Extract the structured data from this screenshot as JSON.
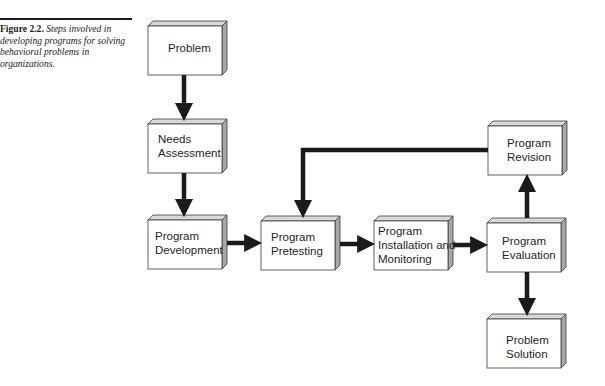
{
  "caption": {
    "figure_label": "Figure 2.2.",
    "text": "Steps involved in developing programs for solving behavioral problems in organizations."
  },
  "colors": {
    "box_face": "#ffffff",
    "box_top": "#d9d9d9",
    "box_side": "#a8a8a8",
    "box_border": "#3a3a3a",
    "arrow": "#1a1a1a"
  },
  "boxes": [
    {
      "id": "problem",
      "label": "Problem"
    },
    {
      "id": "needs-assessment",
      "label": "Needs\nAssessment"
    },
    {
      "id": "program-development",
      "label": "Program\nDevelopment"
    },
    {
      "id": "program-pretesting",
      "label": "Program\nPretesting"
    },
    {
      "id": "program-installation",
      "label": "Program\nInstallation and\nMonitoring"
    },
    {
      "id": "program-evaluation",
      "label": "Program\nEvaluation"
    },
    {
      "id": "program-revision",
      "label": "Program\nRevision"
    },
    {
      "id": "problem-solution",
      "label": "Problem\nSolution"
    }
  ],
  "edges": [
    {
      "from": "Problem",
      "to": "Needs Assessment"
    },
    {
      "from": "Needs Assessment",
      "to": "Program Development"
    },
    {
      "from": "Program Development",
      "to": "Program Pretesting"
    },
    {
      "from": "Program Pretesting",
      "to": "Program Installation and Monitoring"
    },
    {
      "from": "Program Installation and Monitoring",
      "to": "Program Evaluation"
    },
    {
      "from": "Program Evaluation",
      "to": "Program Revision"
    },
    {
      "from": "Program Evaluation",
      "to": "Problem Solution"
    },
    {
      "from": "Program Revision",
      "to": "Program Pretesting"
    }
  ]
}
